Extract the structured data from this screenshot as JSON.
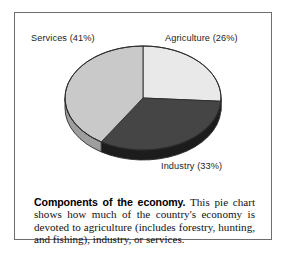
{
  "figure": {
    "caption_lead": "Components of the economy.",
    "caption_body": " This pie chart shows how much of the country's economy is devoted to agriculture (includes forestry, hunting, and fishing), industry, or services.",
    "frame_color": "#6e6e6e",
    "background": "#ffffff"
  },
  "labels": {
    "services": "Services (41%)",
    "agriculture": "Agriculture (26%)",
    "industry": "Industry (33%)"
  },
  "chart_data": {
    "type": "pie",
    "title": "Components of the economy",
    "xlabel": "",
    "ylabel": "",
    "categories": [
      "Agriculture",
      "Industry",
      "Services"
    ],
    "values": [
      26,
      33,
      41
    ],
    "value_unit": "percent",
    "data_labels": [
      "Agriculture (26%)",
      "Industry (33%)",
      "Services (41%)"
    ],
    "colors": [
      "#e9e9e9",
      "#454545",
      "#c9c9c9"
    ],
    "side_colors": [
      "#bdbdbd",
      "#1c1c1c",
      "#9e9e9e"
    ],
    "outline_color": "#2b2b2b",
    "start_angle_deg": 0,
    "direction": "clockwise",
    "projection": "3d",
    "legend": "none",
    "grid": false,
    "label_placement": "outside"
  }
}
